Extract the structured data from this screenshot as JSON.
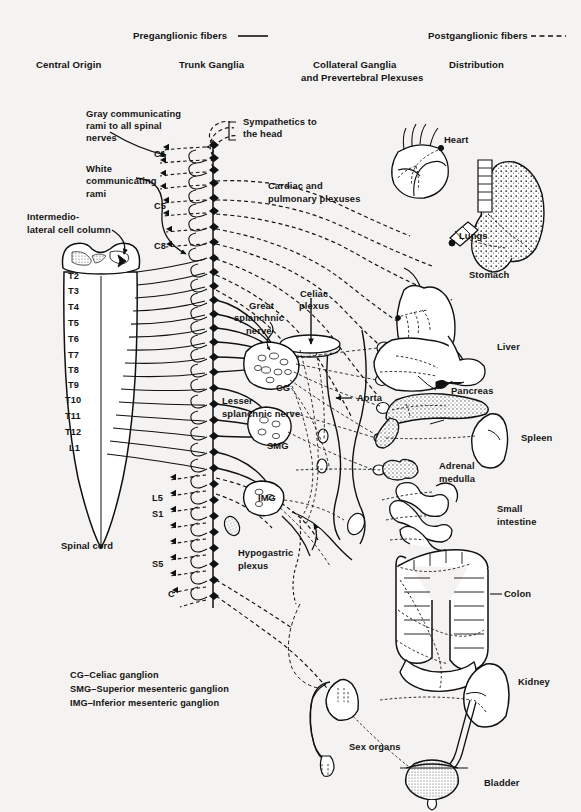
{
  "figure": {
    "background_color": "#f4f3f1",
    "ink_color": "#111111"
  },
  "key": {
    "preganglionic": "Preganglionic fibers ———",
    "preganglionic_text": "Preganglionic fibers",
    "postganglionic": "Postganglionic fibers - - - -",
    "postganglionic_text": "Postganglionic fibers"
  },
  "columns": [
    {
      "label": "Central Origin"
    },
    {
      "label": "Trunk Ganglia"
    },
    {
      "label": "Collateral Ganglia"
    },
    {
      "label": "and Prevertebral Plexuses"
    },
    {
      "label": "Distribution"
    }
  ],
  "column_headers": {
    "central_origin": "Central Origin",
    "trunk_ganglia": "Trunk Ganglia",
    "collateral_line1": "Collateral Ganglia",
    "collateral_line2": "and Prevertebral Plexuses",
    "distribution": "Distribution"
  },
  "left_annotations": {
    "gray_rami_l1": "Gray communicating",
    "gray_rami_l2": "rami to all spinal",
    "gray_rami_l3": "nerves",
    "white_rami_l1": "White",
    "white_rami_l2": "communicating",
    "white_rami_l3": "rami",
    "intermediolateral_l1": "Intermedio-",
    "intermediolateral_l2": "lateral cell column",
    "spinal_cord": "Spinal cord"
  },
  "center_annotations": {
    "sympathetics_head_l1": "Sympathetics to",
    "sympathetics_head_l2": "the head",
    "cardiac_pulmonary_l1": "Cardiac and",
    "cardiac_pulmonary_l2": "pulmonary plexuses",
    "great_splanchnic_l1": "Great",
    "great_splanchnic_l2": "splanchnic",
    "great_splanchnic_l3": "nerve",
    "celiac_plexus_l1": "Celiac",
    "celiac_plexus_l2": "plexus",
    "lesser_splanchnic_l1": "Lesser",
    "lesser_splanchnic_l2": "splanchnic nerve",
    "hypogastric_l1": "Hypogastric",
    "hypogastric_l2": "plexus",
    "cg": "CG",
    "smg": "SMG",
    "img": "IMG",
    "aorta": "Aorta"
  },
  "spinal_segments": [
    "C1",
    "C5",
    "C8",
    "T2",
    "T3",
    "T4",
    "T5",
    "T6",
    "T7",
    "T8",
    "T9",
    "T10",
    "T11",
    "T12",
    "L1",
    "L5",
    "S1",
    "S5",
    "C"
  ],
  "organs": [
    {
      "name": "Heart"
    },
    {
      "name": "Lungs"
    },
    {
      "name": "Stomach"
    },
    {
      "name": "Liver"
    },
    {
      "name": "Pancreas"
    },
    {
      "name": "Spleen"
    },
    {
      "name": "Adrenal medulla",
      "line1": "Adrenal",
      "line2": "medulla"
    },
    {
      "name": "Small intestine",
      "line1": "Small",
      "line2": "intestine"
    },
    {
      "name": "Colon"
    },
    {
      "name": "Kidney"
    },
    {
      "name": "Sex organs"
    },
    {
      "name": "Bladder"
    }
  ],
  "organ_labels": {
    "heart": "Heart",
    "lungs": "Lungs",
    "stomach": "Stomach",
    "liver": "Liver",
    "pancreas": "Pancreas",
    "spleen": "Spleen",
    "adrenal_l1": "Adrenal",
    "adrenal_l2": "medulla",
    "small_intestine_l1": "Small",
    "small_intestine_l2": "intestine",
    "colon": "Colon",
    "kidney": "Kidney",
    "sex_organs": "Sex organs",
    "bladder": "Bladder"
  },
  "legend": {
    "line1": "CG–Celiac ganglion",
    "line2": "SMG–Superior mesenteric ganglion",
    "line3": "IMG–Inferior mesenteric ganglion"
  }
}
